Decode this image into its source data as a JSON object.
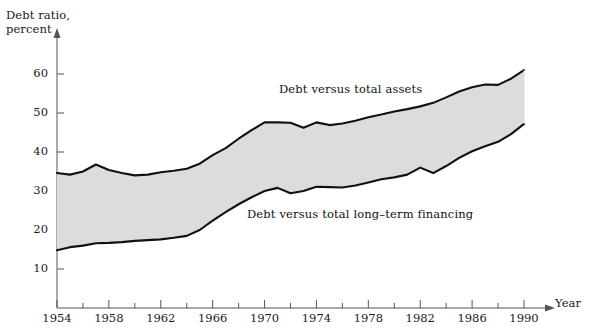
{
  "chart_data": {
    "type": "area",
    "title": "",
    "ylabel": "Debt ratio,\npercent",
    "xlabel": "Year",
    "xlim": [
      1954,
      1993
    ],
    "ylim": [
      0,
      66
    ],
    "grid": false,
    "legend_position": "inline-annotations",
    "yticks": [
      10,
      20,
      30,
      40,
      50,
      60
    ],
    "ytick_labels": [
      "10",
      "20",
      "30",
      "40",
      "50",
      "60"
    ],
    "xticks": [
      1954,
      1958,
      1962,
      1966,
      1970,
      1974,
      1978,
      1982,
      1986,
      1990
    ],
    "xtick_labels": [
      "1954",
      "1958",
      "1962",
      "1966",
      "1970",
      "1974",
      "1978",
      "1982",
      "1986",
      "1990"
    ],
    "xminor_ticks": [
      1956,
      1960,
      1964,
      1968,
      1972,
      1976,
      1980,
      1984,
      1988
    ],
    "x": [
      1954,
      1955,
      1956,
      1957,
      1958,
      1959,
      1960,
      1961,
      1962,
      1963,
      1964,
      1965,
      1966,
      1967,
      1968,
      1969,
      1970,
      1971,
      1972,
      1973,
      1974,
      1975,
      1976,
      1977,
      1978,
      1979,
      1980,
      1981,
      1982,
      1983,
      1984,
      1985,
      1986,
      1987,
      1988,
      1989,
      1990
    ],
    "series": [
      {
        "name": "Debt versus total assets",
        "label": "Debt versus total assets",
        "fill_color": "#dcdcdc",
        "line_color": "#111111",
        "values": [
          34.6,
          34.2,
          35.0,
          36.8,
          35.4,
          34.6,
          34.0,
          34.2,
          34.8,
          35.2,
          35.7,
          37.0,
          39.2,
          41.0,
          43.4,
          45.6,
          47.6,
          47.6,
          47.5,
          46.2,
          47.6,
          46.9,
          47.3,
          48.0,
          48.9,
          49.6,
          50.4,
          51.0,
          51.7,
          52.6,
          54.0,
          55.5,
          56.6,
          57.3,
          57.2,
          58.8,
          61.0
        ]
      },
      {
        "name": "Debt versus total long-term financing",
        "label": "Debt versus total long–term financing",
        "line_color": "#111111",
        "values": [
          14.8,
          15.6,
          16.0,
          16.6,
          16.7,
          16.9,
          17.2,
          17.4,
          17.6,
          18.0,
          18.5,
          20.0,
          22.4,
          24.6,
          26.6,
          28.4,
          30.0,
          30.8,
          29.4,
          30.0,
          31.1,
          31.0,
          30.9,
          31.4,
          32.2,
          33.0,
          33.5,
          34.2,
          36.0,
          34.6,
          36.4,
          38.5,
          40.2,
          41.5,
          42.6,
          44.6,
          47.2
        ]
      }
    ]
  },
  "annotations": {
    "upper_label": "Debt versus total assets",
    "lower_label": "Debt versus total long–term financing"
  },
  "axis": {
    "y_title_line1": "Debt ratio,",
    "y_title_line2": "percent",
    "x_title": "Year"
  }
}
